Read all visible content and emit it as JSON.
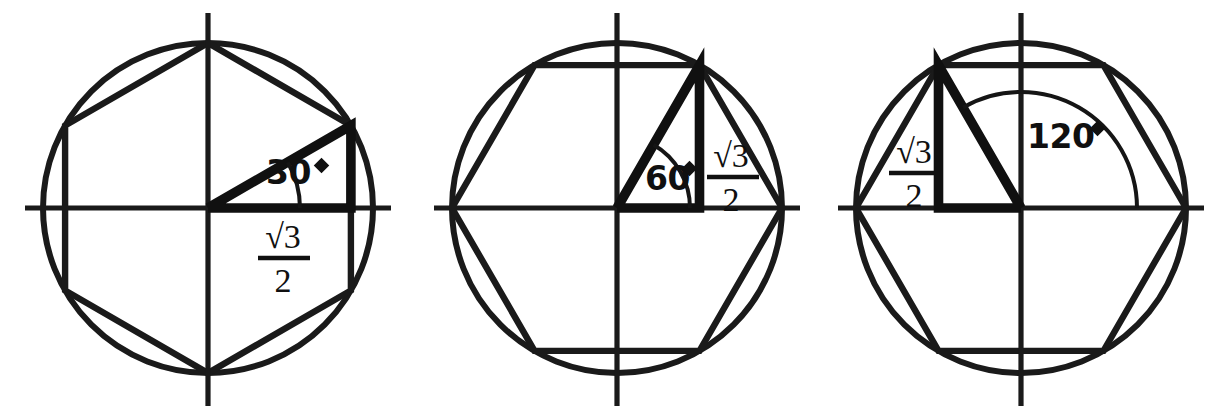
{
  "figure": {
    "background_color": "#ffffff",
    "ink_color": "#101010",
    "panel_count": 3
  },
  "panels": [
    {
      "id": "panel-30",
      "name": "thirty-degree-diagram",
      "angle_label": "30",
      "degree_symbol": "°",
      "length_label_numerator": "√3",
      "length_label_denominator": "2",
      "length_label": "√3/2",
      "angle_degrees": 30,
      "hexagon_orientation": "pointy-top",
      "hexagon_vertex_angles": [
        30,
        90,
        150,
        210,
        270,
        330
      ],
      "triangle_description": "right triangle from origin to vertex at 30 degrees with horizontal leg on x-axis",
      "length_label_position": "below-x-axis",
      "angle_label_position": "inside-triangle"
    },
    {
      "id": "panel-60",
      "name": "sixty-degree-diagram",
      "angle_label": "60",
      "degree_symbol": "°",
      "length_label_numerator": "√3",
      "length_label_denominator": "2",
      "length_label": "√3/2",
      "angle_degrees": 60,
      "hexagon_orientation": "flat-top",
      "hexagon_vertex_angles": [
        0,
        60,
        120,
        180,
        240,
        300
      ],
      "triangle_description": "right triangle from origin to vertex at 60 degrees with vertical leg",
      "length_label_position": "right-of-vertical-leg",
      "angle_label_position": "inside-triangle"
    },
    {
      "id": "panel-120",
      "name": "one-hundred-twenty-degree-diagram",
      "angle_label": "120",
      "degree_symbol": "°",
      "length_label_numerator": "√3",
      "length_label_denominator": "2",
      "length_label": "√3/2",
      "angle_degrees": 120,
      "hexagon_orientation": "flat-top",
      "hexagon_vertex_angles": [
        0,
        60,
        120,
        180,
        240,
        300
      ],
      "triangle_description": "right triangle from origin to vertex at 120 degrees with vertical leg on the left",
      "length_label_position": "left-of-vertical-leg",
      "angle_label_position": "right-of-vertical-axis"
    }
  ]
}
